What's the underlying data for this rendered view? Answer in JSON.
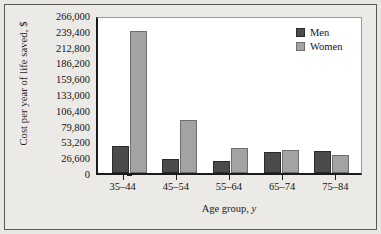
{
  "chart_data": {
    "type": "bar",
    "title": "",
    "xlabel": "Age group, y",
    "xlabel_main": "Age group,",
    "xlabel_italic": "y",
    "ylabel": "Cost per year of life saved, $",
    "categories": [
      "35–44",
      "45–54",
      "55–64",
      "65–74",
      "75–84"
    ],
    "series": [
      {
        "name": "Men",
        "color": "#4b4b4b",
        "values": [
          45500,
          23600,
          20200,
          35400,
          37000
        ]
      },
      {
        "name": "Women",
        "color": "#a3a3a3",
        "values": [
          239000,
          89000,
          42000,
          38700,
          30300
        ]
      }
    ],
    "ylim": [
      0,
      266000
    ],
    "ytick_values": [
      266000,
      239400,
      212800,
      186200,
      159600,
      133000,
      106400,
      79800,
      53200,
      26600,
      0
    ],
    "ytick_labels": [
      "266,000",
      "239,400",
      "212,800",
      "186,200",
      "159,600",
      "133,000",
      "106,400",
      "79,800",
      "53,200",
      "26,600",
      "0"
    ],
    "grid": false,
    "legend_position": "top-right"
  },
  "legend": {
    "entries": [
      {
        "label": "Men"
      },
      {
        "label": "Women"
      }
    ]
  }
}
